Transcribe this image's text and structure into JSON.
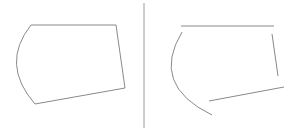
{
  "diagram": {
    "stroke_color": "#8a8a8a",
    "divider_color": "#9a9a9a",
    "background": "#ffffff",
    "left_shape": {
      "type": "closed-path",
      "top_edge": [
        [
          31,
          25
        ],
        [
          116,
          25
        ]
      ],
      "right_edge": [
        [
          116,
          25
        ],
        [
          125,
          88
        ]
      ],
      "bottom_edge": [
        [
          125,
          88
        ],
        [
          35,
          104
        ]
      ],
      "arc_edge": {
        "start": [
          35,
          104
        ],
        "control": [
          0,
          64
        ],
        "end": [
          31,
          25
        ]
      }
    },
    "divider": {
      "x": 144,
      "y1": 3,
      "y2": 128
    },
    "right_shape": {
      "type": "separate-segments",
      "top_segment": [
        [
          181,
          26
        ],
        [
          274,
          26
        ]
      ],
      "right_segment": [
        [
          272,
          34
        ],
        [
          278,
          76
        ]
      ],
      "bottom_segment": [
        [
          209,
          101
        ],
        [
          284,
          87
        ]
      ],
      "arc_segment": {
        "start": [
          182,
          32
        ],
        "control": [
          150,
          85
        ],
        "end": [
          212,
          115
        ]
      }
    }
  }
}
